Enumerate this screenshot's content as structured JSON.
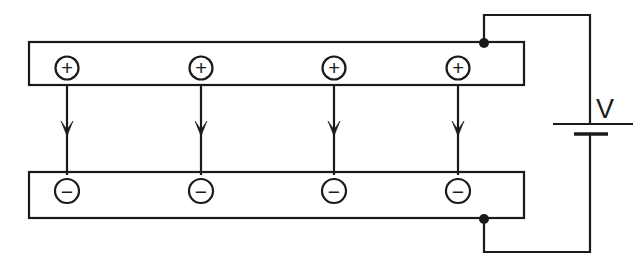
{
  "diagram": {
    "type": "circuit-schematic",
    "stroke_color": "#1a1a1a",
    "fill_color": "#ffffff",
    "background_color": "#ffffff",
    "stroke_width": 2.2
  },
  "top_plate": {
    "name": "positive-plate",
    "x": 29,
    "y": 42,
    "width": 495,
    "height": 43,
    "charges": [
      {
        "symbol": "+",
        "cx": 67,
        "cy": 68,
        "r": 11.5
      },
      {
        "symbol": "+",
        "cx": 201,
        "cy": 68,
        "r": 11.5
      },
      {
        "symbol": "+",
        "cx": 334,
        "cy": 68,
        "r": 11.5
      },
      {
        "symbol": "+",
        "cx": 458,
        "cy": 68,
        "r": 11.5
      }
    ]
  },
  "bottom_plate": {
    "name": "negative-plate",
    "x": 29,
    "y": 172,
    "width": 495,
    "height": 46,
    "charges": [
      {
        "symbol": "−",
        "cx": 67,
        "cy": 191,
        "r": 12
      },
      {
        "symbol": "−",
        "cx": 201,
        "cy": 191,
        "r": 12
      },
      {
        "symbol": "−",
        "cx": 334,
        "cy": 191,
        "r": 12
      },
      {
        "symbol": "−",
        "cx": 458,
        "cy": 191,
        "r": 12
      }
    ]
  },
  "field_arrows": [
    {
      "x": 67,
      "y_start": 85,
      "y_end": 175,
      "head_y": 136
    },
    {
      "x": 201,
      "y_start": 85,
      "y_end": 175,
      "head_y": 136
    },
    {
      "x": 334,
      "y_start": 85,
      "y_end": 175,
      "head_y": 136
    },
    {
      "x": 458,
      "y_start": 85,
      "y_end": 175,
      "head_y": 136
    }
  ],
  "junctions": [
    {
      "name": "top-terminal-junction",
      "cx": 484,
      "cy": 43,
      "r": 5
    },
    {
      "name": "bottom-terminal-junction",
      "cx": 484,
      "cy": 219,
      "r": 5
    }
  ],
  "wires": {
    "top_path": "M 484 43 L 484 15 L 590 15 L 590 124",
    "bottom_path": "M 484 219 L 484 252 L 590 252 L 590 134"
  },
  "battery": {
    "name": "voltage-source",
    "label": "V",
    "label_x": 596,
    "label_y": 118,
    "positive_plate_line": {
      "x1": 553,
      "y1": 124,
      "x2": 633,
      "y2": 124
    },
    "negative_plate_line": {
      "x1": 574,
      "y1": 134,
      "x2": 608,
      "y2": 134
    }
  }
}
